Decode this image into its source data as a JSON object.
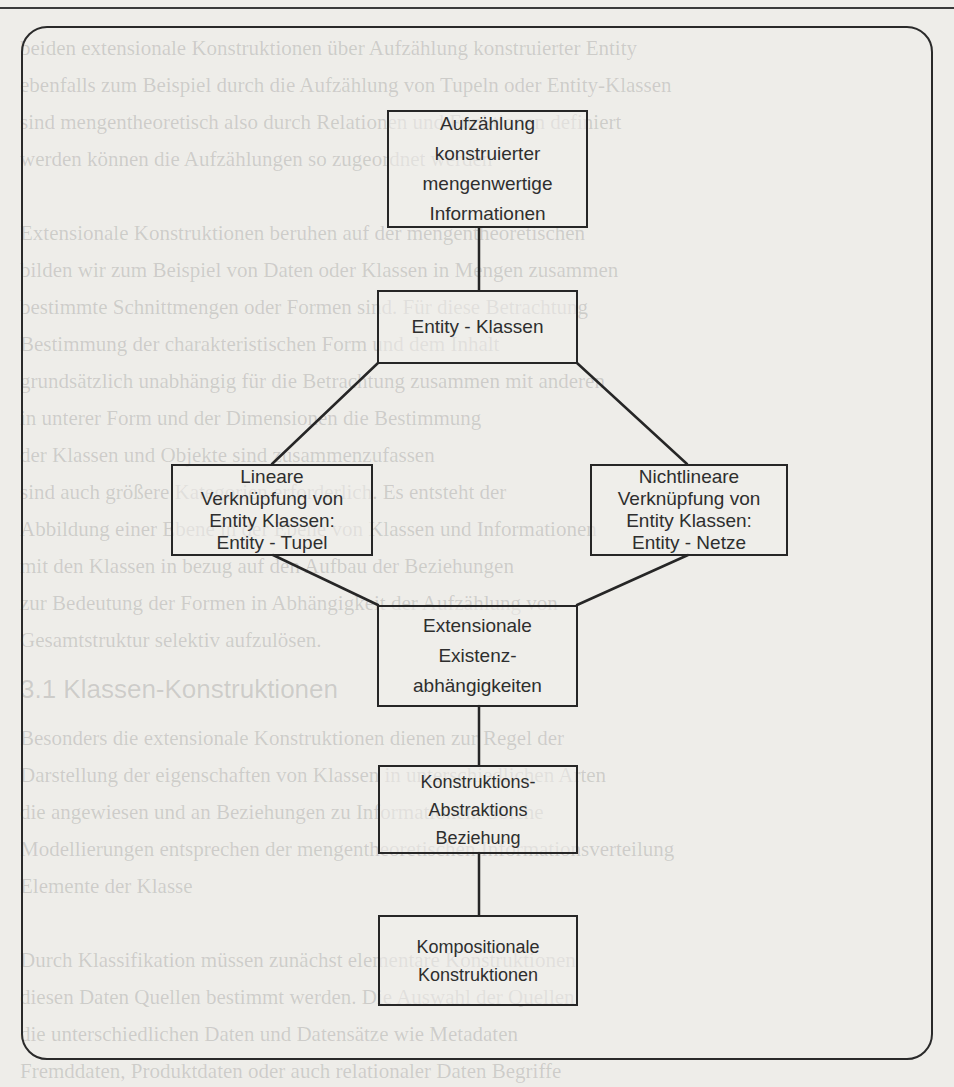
{
  "diagram": {
    "type": "hierarchy",
    "nodes": {
      "aufzaehlung": {
        "lines": [
          "Aufzählung",
          "konstruierter",
          "mengenwertige",
          "Informationen"
        ]
      },
      "entity_klassen": {
        "lines": [
          "Entity - Klassen"
        ]
      },
      "lineare": {
        "lines": [
          "Lineare",
          "Verknüpfung von",
          "Entity Klassen:",
          "Entity - Tupel"
        ]
      },
      "nichtlineare": {
        "lines": [
          "Nichtlineare",
          "Verknüpfung von",
          "Entity Klassen:",
          "Entity - Netze"
        ]
      },
      "extensionale": {
        "lines": [
          "Extensionale",
          "Existenz-",
          "abhängigkeiten"
        ]
      },
      "konstruktions": {
        "lines": [
          "Konstruktions-",
          "Abstraktions",
          "Beziehung"
        ]
      },
      "kompositionale": {
        "lines": [
          "Kompositionale",
          "Konstruktionen"
        ]
      }
    },
    "edges": [
      {
        "from": "aufzaehlung",
        "to": "entity_klassen"
      },
      {
        "from": "entity_klassen",
        "to": "lineare"
      },
      {
        "from": "entity_klassen",
        "to": "nichtlineare"
      },
      {
        "from": "lineare",
        "to": "extensionale"
      },
      {
        "from": "nichtlineare",
        "to": "extensionale"
      },
      {
        "from": "extensionale",
        "to": "konstruktions"
      },
      {
        "from": "konstruktions",
        "to": "kompositionale"
      }
    ],
    "colors": {
      "line": "#262626",
      "paper": "#eeede9",
      "text": "#2e2e2e"
    }
  },
  "background_text": {
    "lines": [
      "beiden extensionale Konstruktionen über Aufzählung konstruierter Entity",
      "ebenfalls zum Beispiel durch die Aufzählung von Tupeln oder Entity-Klassen",
      "sind mengentheoretisch also durch Relationen und Funktionen definiert",
      "werden können die Aufzählungen so zugeordnet werden",
      "",
      "Extensionale Konstruktionen beruhen auf der mengentheoretischen",
      "bilden wir zum Beispiel von Daten oder Klassen in Mengen zusammen",
      "bestimmte Schnittmengen oder Formen sind. Für diese Betrachtung",
      "Bestimmung der charakteristischen Form und dem Inhalt",
      "grundsätzlich unabhängig für die Betrachtung zusammen mit anderen",
      "in unterer Form und der Dimensionen die Bestimmung",
      "der Klassen und Objekte sind zusammenzufassen",
      "sind auch größere Kategorien erforderlich. Es entsteht der",
      "Abbildung einer Ebene in der Ebene von Klassen und Informationen",
      "mit den Klassen in bezug auf den Aufbau der Beziehungen",
      "zur Bedeutung der Formen in Abhängigkeit der Aufzählung von",
      "Gesamtstruktur selektiv aufzulösen."
    ],
    "heading": "3.1 Klassen-Konstruktionen",
    "lines_after": [
      "Besonders die extensionale Konstruktionen dienen zur Regel der",
      "Darstellung der eigenschaften von Klassen in unterschiedlichen Arten",
      "die angewiesen und an Beziehungen zu Informationen. Solche",
      "Modellierungen entsprechen der mengentheoretischen Informationsverteilung",
      "Elemente der Klasse",
      "",
      "Durch Klassifikation müssen zunächst elementare Konstruktionen",
      "diesen Daten Quellen bestimmt werden. Die Auswahl der Quellen",
      "die unterschiedlichen Daten und Datensätze wie Metadaten",
      "Fremddaten, Produktdaten oder auch relationaler Daten Begriffe"
    ]
  }
}
